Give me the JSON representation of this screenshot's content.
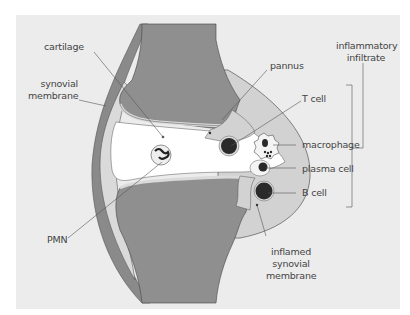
{
  "diagram": {
    "colors": {
      "background": "#ececec",
      "bone": "#8f8f8f",
      "capsule": "#8a8a8a",
      "synovial_membrane": "#d9d9d9",
      "pannus": "#d2d2d2",
      "joint_space": "#ffffff",
      "cell_dark": "#2a2a2a"
    },
    "labels": {
      "cartilage": "cartilage",
      "synovial_membrane": [
        "synovial",
        "membrane"
      ],
      "pmn": "PMN",
      "pannus": "pannus",
      "inflammatory_infiltrate": [
        "inflammatory",
        "infiltrate"
      ],
      "t_cell": "T cell",
      "macrophage": "macrophage",
      "plasma_cell": "plasma cell",
      "b_cell": "B cell",
      "inflamed_synovial_membrane": [
        "inflamed",
        "synovial",
        "membrane"
      ]
    }
  }
}
